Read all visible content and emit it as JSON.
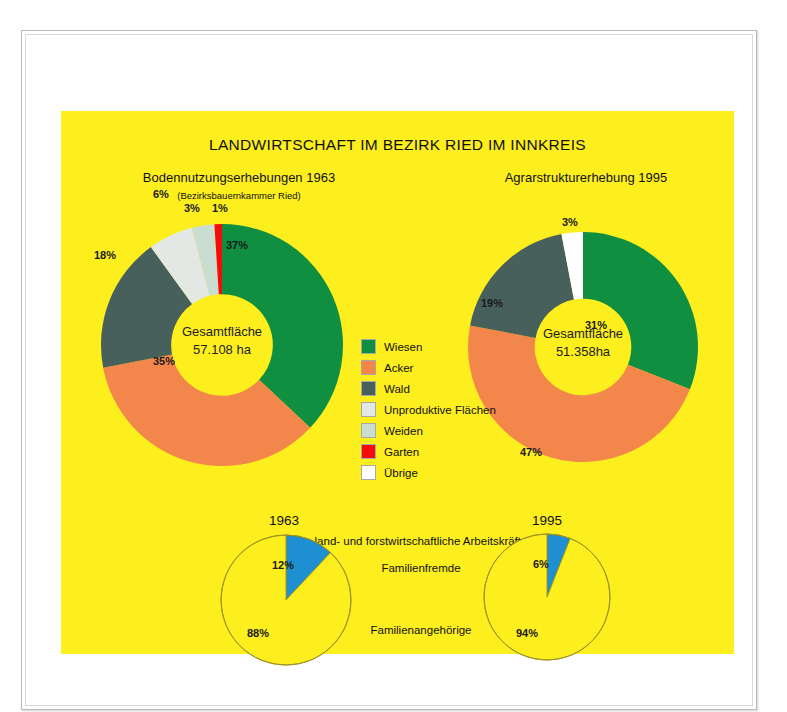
{
  "poster": {
    "title": "LANDWIRTSCHAFT IM BEZIRK RIED IM INNKREIS",
    "background_color": "#fdee1e",
    "left_subtitle": "Bodennutzungserhebungen 1963",
    "left_subtitle_note": "(Bezirksbauernkammer Ried)",
    "right_subtitle": "Agrarstrukturerhebung 1995"
  },
  "legend": {
    "items": [
      {
        "label": "Wiesen",
        "color": "#0f8f3f"
      },
      {
        "label": "Acker",
        "color": "#f3864a"
      },
      {
        "label": "Wald",
        "color": "#47605c"
      },
      {
        "label": "Unproduktive Flächen",
        "color": "#e4e8e4"
      },
      {
        "label": "Weiden",
        "color": "#c9ddd0"
      },
      {
        "label": "Garten",
        "color": "#f40c0c"
      },
      {
        "label": "Übrige",
        "color": "#ffffff"
      }
    ]
  },
  "chart_data": [
    {
      "type": "pie",
      "name": "bodennutzung-1963",
      "title": "Bodennutzungserhebungen 1963",
      "subtitle": "(Bezirksbauernkammer Ried)",
      "center_line1": "Gesamtfläche",
      "center_line2": "57.108 ha",
      "total_area_ha": "57.108",
      "unit": "ha",
      "hole_ratio": 0.42,
      "start_angle_deg": 0,
      "legend_position": "center",
      "categories": [
        "Wiesen",
        "Acker",
        "Wald",
        "Unproduktive Flächen",
        "Weiden",
        "Garten"
      ],
      "values": [
        37,
        35,
        18,
        6,
        3,
        1
      ],
      "labels": [
        "37%",
        "35%",
        "18%",
        "6%",
        "3%",
        "1%"
      ],
      "colors": [
        "#0f8f3f",
        "#f3864a",
        "#47605c",
        "#e4e8e4",
        "#c9ddd0",
        "#f40c0c"
      ]
    },
    {
      "type": "pie",
      "name": "agrarstruktur-1995",
      "title": "Agrarstrukturerhebung 1995",
      "center_line1": "Gesamtfläche",
      "center_line2": "51.358ha",
      "total_area_ha": "51.358",
      "unit": "ha",
      "hole_ratio": 0.42,
      "start_angle_deg": 0,
      "legend_position": "center",
      "categories": [
        "Wiesen",
        "Acker",
        "Wald",
        "Übrige"
      ],
      "values": [
        31,
        47,
        19,
        3
      ],
      "labels": [
        "31%",
        "47%",
        "19%",
        "3%"
      ],
      "colors": [
        "#0f8f3f",
        "#f3864a",
        "#47605c",
        "#ffffff"
      ]
    },
    {
      "type": "pie",
      "name": "arbeitskraefte-1963",
      "title": "1963",
      "group_title": "land- und forstwirtschaftliche Arbeitskräfte",
      "categories": [
        "Familienfremde",
        "Familienangehörige"
      ],
      "values": [
        12,
        88
      ],
      "labels": [
        "12%",
        "88%"
      ],
      "colors": [
        "#1e90d2",
        "#fdee1e"
      ],
      "outline_color": "#9a8f20",
      "hole_ratio": 0
    },
    {
      "type": "pie",
      "name": "arbeitskraefte-1995",
      "title": "1995",
      "group_title": "land- und forstwirtschaftliche Arbeitskräfte",
      "categories": [
        "Familienfremde",
        "Familienangehörige"
      ],
      "values": [
        6,
        94
      ],
      "labels": [
        "6%",
        "94%"
      ],
      "colors": [
        "#1e90d2",
        "#fdee1e"
      ],
      "outline_color": "#9a8f20",
      "hole_ratio": 0
    }
  ],
  "workforce": {
    "heading": "land- und forstwirtschaftliche Arbeitskräfte",
    "category_external": "Familienfremde",
    "category_family": "Familienangehörige",
    "left_year": "1963",
    "right_year": "1995",
    "left_external_pct": "12%",
    "left_family_pct": "88%",
    "right_external_pct": "6%",
    "right_family_pct": "94%"
  }
}
